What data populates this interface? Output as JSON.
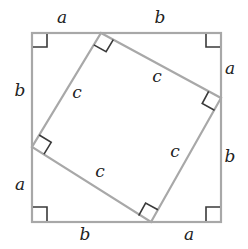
{
  "diagram": {
    "colors": {
      "line": "#a8a8a8",
      "marker": "#3a3a3a",
      "text": "#222222",
      "background": "#ffffff"
    },
    "outer_square": {
      "x1": 32,
      "y1": 33,
      "x2": 221,
      "y2": 222
    },
    "inner_square": {
      "top": [
        101,
        33
      ],
      "right": [
        221,
        98
      ],
      "bottom": [
        151,
        222
      ],
      "left": [
        32,
        147
      ]
    },
    "labels": {
      "top_a": "a",
      "top_b": "b",
      "right_a": "a",
      "right_b": "b",
      "bottom_b": "b",
      "bottom_a": "a",
      "left_b": "b",
      "left_a": "a",
      "hyp_top_left": "c",
      "hyp_top_right": "c",
      "hyp_bottom_left": "c",
      "hyp_bottom_right": "c"
    }
  }
}
